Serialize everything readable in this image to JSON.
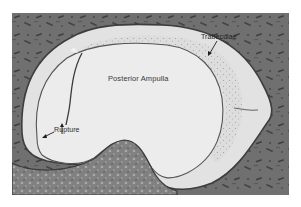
{
  "figure": {
    "labels": {
      "trabeculae": "Trabeculae",
      "ampulla": "Posterior Ampulla",
      "rupture": "Rupture"
    },
    "colors": {
      "tissue_dark": "#5f5f5f",
      "tissue_mid": "#7a7a7a",
      "lumen": "#e9e9e9",
      "outer_lumen": "#dedede",
      "membrane": "#4a4a4a",
      "page_background": "#ffffff"
    }
  }
}
